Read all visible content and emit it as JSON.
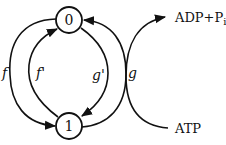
{
  "diagram": {
    "states": [
      {
        "id": "state-0",
        "label": "0"
      },
      {
        "id": "state-1",
        "label": "1"
      }
    ],
    "transitions": [
      {
        "id": "f",
        "label": "f",
        "from": "0",
        "to": "1"
      },
      {
        "id": "f_prime",
        "label": "f'",
        "from": "1",
        "to": "0"
      },
      {
        "id": "g_prime",
        "label": "g'",
        "from": "0",
        "to": "1"
      },
      {
        "id": "g",
        "label": "g",
        "from": "1",
        "to": "0"
      }
    ],
    "reaction": {
      "input": "ATP",
      "output_base": "ADP+P",
      "output_sub": "i"
    },
    "colors": {
      "stroke": "#111111",
      "background": "#ffffff"
    }
  }
}
